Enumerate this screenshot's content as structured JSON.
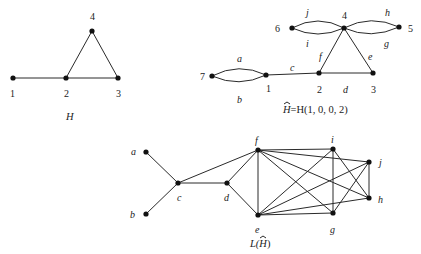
{
  "graph_H": {
    "caption": "H",
    "nodes": [
      {
        "id": "1",
        "label": "1",
        "x": 13,
        "y": 78
      },
      {
        "id": "2",
        "label": "2",
        "x": 66,
        "y": 78
      },
      {
        "id": "3",
        "label": "3",
        "x": 118,
        "y": 78
      },
      {
        "id": "4",
        "label": "4",
        "x": 92,
        "y": 31
      }
    ],
    "edges": [
      [
        "1",
        "2"
      ],
      [
        "2",
        "3"
      ],
      [
        "2",
        "4"
      ],
      [
        "3",
        "4"
      ]
    ]
  },
  "graph_Hhat": {
    "caption_hat": "H",
    "caption_rest": "=H(1, 0, 0, 2)",
    "nodes": [
      {
        "id": "7",
        "label": "7",
        "x": 212,
        "y": 76
      },
      {
        "id": "1",
        "label": "1",
        "x": 266,
        "y": 75
      },
      {
        "id": "2",
        "label": "2",
        "x": 319,
        "y": 73
      },
      {
        "id": "3",
        "label": "3",
        "x": 373,
        "y": 73
      },
      {
        "id": "4",
        "label": "4",
        "x": 344,
        "y": 28
      },
      {
        "id": "6",
        "label": "6",
        "x": 292,
        "y": 28
      },
      {
        "id": "5",
        "label": "5",
        "x": 399,
        "y": 27
      }
    ],
    "edge_labels": {
      "a": "a",
      "b": "b",
      "c": "c",
      "d": "d",
      "e": "e",
      "f": "f",
      "g": "g",
      "h": "h",
      "i": "i",
      "j": "j"
    }
  },
  "graph_LHhat": {
    "caption_prefix": "L(",
    "caption_hat": "H",
    "caption_suffix": ")",
    "nodes": [
      {
        "id": "a",
        "label": "a",
        "x": 146,
        "y": 152
      },
      {
        "id": "b",
        "label": "b",
        "x": 146,
        "y": 214
      },
      {
        "id": "c",
        "label": "c",
        "x": 178,
        "y": 183
      },
      {
        "id": "d",
        "label": "d",
        "x": 227,
        "y": 183
      },
      {
        "id": "f",
        "label": "f",
        "x": 258,
        "y": 150
      },
      {
        "id": "e",
        "label": "e",
        "x": 258,
        "y": 215
      },
      {
        "id": "i",
        "label": "i",
        "x": 333,
        "y": 149
      },
      {
        "id": "j",
        "label": "j",
        "x": 369,
        "y": 162
      },
      {
        "id": "h",
        "label": "h",
        "x": 369,
        "y": 198
      },
      {
        "id": "g",
        "label": "g",
        "x": 333,
        "y": 213
      }
    ],
    "edges": [
      [
        "a",
        "c"
      ],
      [
        "b",
        "c"
      ],
      [
        "c",
        "d"
      ],
      [
        "c",
        "f"
      ],
      [
        "d",
        "f"
      ],
      [
        "d",
        "e"
      ],
      [
        "f",
        "e"
      ],
      [
        "f",
        "i"
      ],
      [
        "f",
        "j"
      ],
      [
        "f",
        "h"
      ],
      [
        "f",
        "g"
      ],
      [
        "e",
        "i"
      ],
      [
        "e",
        "j"
      ],
      [
        "e",
        "h"
      ],
      [
        "e",
        "g"
      ],
      [
        "i",
        "g"
      ],
      [
        "i",
        "h"
      ],
      [
        "j",
        "h"
      ],
      [
        "j",
        "g"
      ]
    ]
  }
}
